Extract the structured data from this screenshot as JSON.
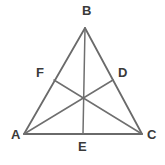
{
  "figure": {
    "kind": "geometry-diagram",
    "background_color": "#ffffff",
    "stroke_color": "#6a6a6a",
    "label_color": "#3a3a3a",
    "stroke_width": 1.6
  },
  "vertices": [
    {
      "id": "B",
      "label": "B",
      "x": 85,
      "y": 28,
      "label_x": 82,
      "label_y": 4
    },
    {
      "id": "A",
      "label": "A",
      "x": 24,
      "y": 134,
      "label_x": 11,
      "label_y": 128
    },
    {
      "id": "C",
      "label": "C",
      "x": 142,
      "y": 134,
      "label_x": 147,
      "label_y": 128
    }
  ],
  "midpoints": [
    {
      "id": "F",
      "label": "F",
      "on_side": "AB",
      "x": 54,
      "y": 80,
      "label_x": 36,
      "label_y": 66
    },
    {
      "id": "D",
      "label": "D",
      "on_side": "BC",
      "x": 113,
      "y": 80,
      "label_x": 118,
      "label_y": 66
    },
    {
      "id": "E",
      "label": "E",
      "on_side": "AC",
      "x": 83,
      "y": 134,
      "label_x": 78,
      "label_y": 140
    }
  ],
  "centroid": {
    "id": "G",
    "x": 83,
    "y": 97
  },
  "sides": [
    {
      "id": "AB",
      "from": "A",
      "to": "B"
    },
    {
      "id": "BC",
      "from": "B",
      "to": "C"
    },
    {
      "id": "AC",
      "from": "A",
      "to": "C"
    }
  ],
  "medians": [
    {
      "id": "BE",
      "from": "B",
      "to": "E"
    },
    {
      "id": "AD",
      "from": "A",
      "to": "D"
    },
    {
      "id": "CF",
      "from": "C",
      "to": "F"
    }
  ]
}
